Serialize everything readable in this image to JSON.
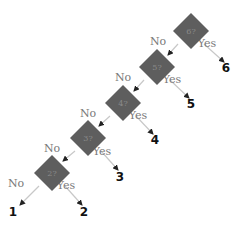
{
  "diagram": {
    "type": "decision-tree",
    "colors": {
      "node_fill": "#5e5e5e",
      "edge": "#c8c8c8",
      "arrow": "#222222",
      "edge_label": "#7a7a7a",
      "leaf": "#111111"
    },
    "nodes": [
      {
        "id": "q6",
        "label": "6?",
        "cx": 191,
        "cy": 31
      },
      {
        "id": "q5",
        "label": "5?",
        "cx": 157,
        "cy": 67
      },
      {
        "id": "q4",
        "label": "4?",
        "cx": 123,
        "cy": 103
      },
      {
        "id": "q3",
        "label": "3?",
        "cx": 88,
        "cy": 138
      },
      {
        "id": "q2",
        "label": "2?",
        "cx": 52,
        "cy": 173
      }
    ],
    "leaves": [
      {
        "id": "l6",
        "label": "6",
        "x": 226,
        "y": 72
      },
      {
        "id": "l5",
        "label": "5",
        "x": 191,
        "y": 108
      },
      {
        "id": "l4",
        "label": "4",
        "x": 155,
        "y": 144
      },
      {
        "id": "l3",
        "label": "3",
        "x": 120,
        "y": 181
      },
      {
        "id": "l2",
        "label": "2",
        "x": 84,
        "y": 216
      },
      {
        "id": "l1",
        "label": "1",
        "x": 13,
        "y": 216
      }
    ],
    "edges": [
      {
        "from": "q6",
        "to": "q5",
        "label": "No",
        "x1": 178,
        "y1": 44,
        "x2": 168,
        "y2": 55,
        "lx": 158,
        "ly": 45
      },
      {
        "from": "q6",
        "to": "l6",
        "label": "Yes",
        "x1": 204,
        "y1": 44,
        "x2": 224,
        "y2": 62,
        "lx": 207,
        "ly": 47
      },
      {
        "from": "q5",
        "to": "q4",
        "label": "No",
        "x1": 144,
        "y1": 80,
        "x2": 134,
        "y2": 91,
        "lx": 123,
        "ly": 81
      },
      {
        "from": "q5",
        "to": "l5",
        "label": "Yes",
        "x1": 170,
        "y1": 80,
        "x2": 189,
        "y2": 98,
        "lx": 172,
        "ly": 83
      },
      {
        "from": "q4",
        "to": "q3",
        "label": "No",
        "x1": 110,
        "y1": 116,
        "x2": 99,
        "y2": 126,
        "lx": 88,
        "ly": 117
      },
      {
        "from": "q4",
        "to": "l4",
        "label": "Yes",
        "x1": 136,
        "y1": 116,
        "x2": 153,
        "y2": 134,
        "lx": 138,
        "ly": 119
      },
      {
        "from": "q3",
        "to": "q2",
        "label": "No",
        "x1": 75,
        "y1": 151,
        "x2": 63,
        "y2": 161,
        "lx": 52,
        "ly": 152
      },
      {
        "from": "q3",
        "to": "l3",
        "label": "Yes",
        "x1": 101,
        "y1": 151,
        "x2": 118,
        "y2": 170,
        "lx": 102,
        "ly": 155
      },
      {
        "from": "q2",
        "to": "l1",
        "label": "No",
        "x1": 39,
        "y1": 186,
        "x2": 20,
        "y2": 205,
        "lx": 16,
        "ly": 187
      },
      {
        "from": "q2",
        "to": "l2",
        "label": "Yes",
        "x1": 65,
        "y1": 186,
        "x2": 82,
        "y2": 205,
        "lx": 66,
        "ly": 189
      }
    ]
  }
}
